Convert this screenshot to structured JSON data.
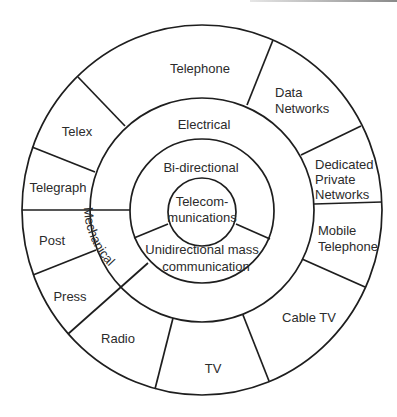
{
  "diagram": {
    "center": {
      "line1": "Telecom-",
      "line2": "munications"
    },
    "ring2": {
      "upper": "Bi-directional",
      "lower": {
        "line1": "Unidirectional mass",
        "line2": "communication"
      }
    },
    "ring3": {
      "upper": "Electrical",
      "left": "Mechanical"
    },
    "outer": {
      "telephone": "Telephone",
      "data_networks": {
        "line1": "Data",
        "line2": "Networks"
      },
      "dedicated": {
        "line1": "Dedicated",
        "line2": "Private",
        "line3": "Networks"
      },
      "mobile": {
        "line1": "Mobile",
        "line2": "Telephone"
      },
      "cable_tv": "Cable TV",
      "tv": "TV",
      "radio": "Radio",
      "press": "Press",
      "post": "Post",
      "telegraph": "Telegraph",
      "telex": "Telex"
    },
    "colors": {
      "line": "#1e1e1e",
      "text": "#2b2b2b",
      "background": "#ffffff"
    }
  }
}
